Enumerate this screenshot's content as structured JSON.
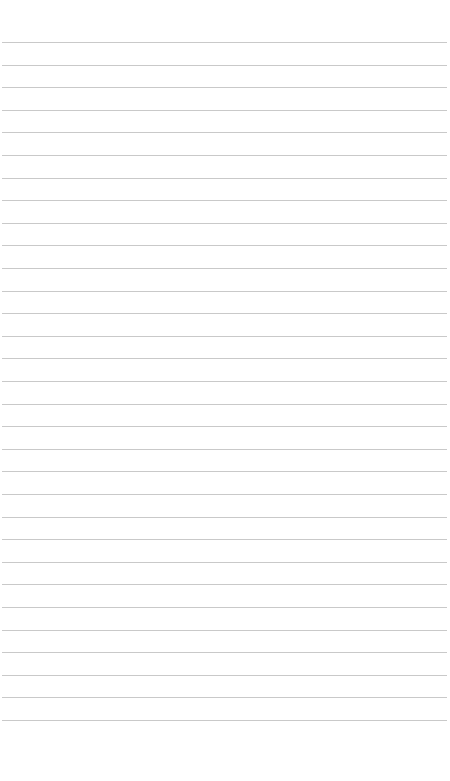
{
  "page": {
    "background": "#ffffff",
    "rule_color": "#c9c9c9",
    "rule_count": 31,
    "first_rule_y": 42,
    "rule_spacing": 22.6,
    "text_lines": []
  }
}
